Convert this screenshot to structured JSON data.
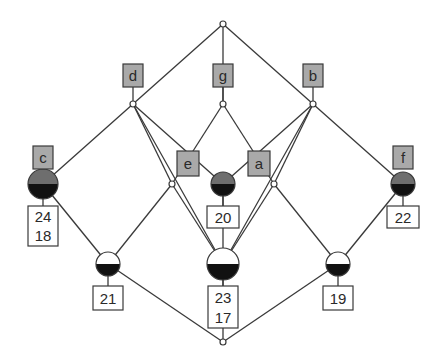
{
  "diagram": {
    "type": "concept-lattice",
    "colors": {
      "edge": "#3a3a3a",
      "attribute_box_fill": "#a9a9a9",
      "object_box_fill": "#ffffff",
      "node_top_gray": "#6e6e6e",
      "node_bottom_black": "#111111",
      "node_white": "#ffffff"
    },
    "nodes": {
      "top": {
        "x": 223,
        "y": 24
      },
      "d": {
        "x": 133,
        "y": 104,
        "attribute": "d"
      },
      "g": {
        "x": 223,
        "y": 104,
        "attribute": "g"
      },
      "b": {
        "x": 313,
        "y": 104,
        "attribute": "b"
      },
      "c": {
        "x": 43,
        "y": 184,
        "attribute": "c",
        "objects": [
          "24",
          "18"
        ]
      },
      "e": {
        "x": 172,
        "y": 184
      },
      "ea": {
        "x": 223,
        "y": 184,
        "objects": [
          "20"
        ]
      },
      "a": {
        "x": 274,
        "y": 184
      },
      "f": {
        "x": 403,
        "y": 184,
        "attribute": "f",
        "objects": [
          "22"
        ]
      },
      "n21": {
        "x": 108,
        "y": 264,
        "objects": [
          "21"
        ]
      },
      "n23": {
        "x": 223,
        "y": 264,
        "objects": [
          "23",
          "17"
        ]
      },
      "n19": {
        "x": 338,
        "y": 264,
        "objects": [
          "19"
        ]
      },
      "bottom": {
        "x": 223,
        "y": 342
      }
    },
    "attribute_labels": {
      "d": "d",
      "g": "g",
      "b": "b",
      "c": "c",
      "e": "e",
      "a": "a",
      "f": "f"
    },
    "object_labels": {
      "c_line1": "24",
      "c_line2": "18",
      "ea": "20",
      "f": "22",
      "n21": "21",
      "n23_line1": "23",
      "n23_line2": "17",
      "n19": "19"
    },
    "edges": [
      [
        "top",
        "d"
      ],
      [
        "top",
        "g"
      ],
      [
        "top",
        "b"
      ],
      [
        "d",
        "c"
      ],
      [
        "d",
        "e"
      ],
      [
        "d",
        "ea"
      ],
      [
        "d",
        "n23"
      ],
      [
        "g",
        "e"
      ],
      [
        "g",
        "a"
      ],
      [
        "b",
        "ea"
      ],
      [
        "b",
        "a"
      ],
      [
        "b",
        "f"
      ],
      [
        "b",
        "n23"
      ],
      [
        "c",
        "n21"
      ],
      [
        "c",
        "bottom"
      ],
      [
        "e",
        "n21"
      ],
      [
        "e",
        "n23"
      ],
      [
        "ea",
        "n23"
      ],
      [
        "a",
        "n23"
      ],
      [
        "a",
        "n19"
      ],
      [
        "f",
        "n19"
      ],
      [
        "n21",
        "bottom"
      ],
      [
        "n23",
        "bottom"
      ],
      [
        "n19",
        "bottom"
      ]
    ]
  }
}
